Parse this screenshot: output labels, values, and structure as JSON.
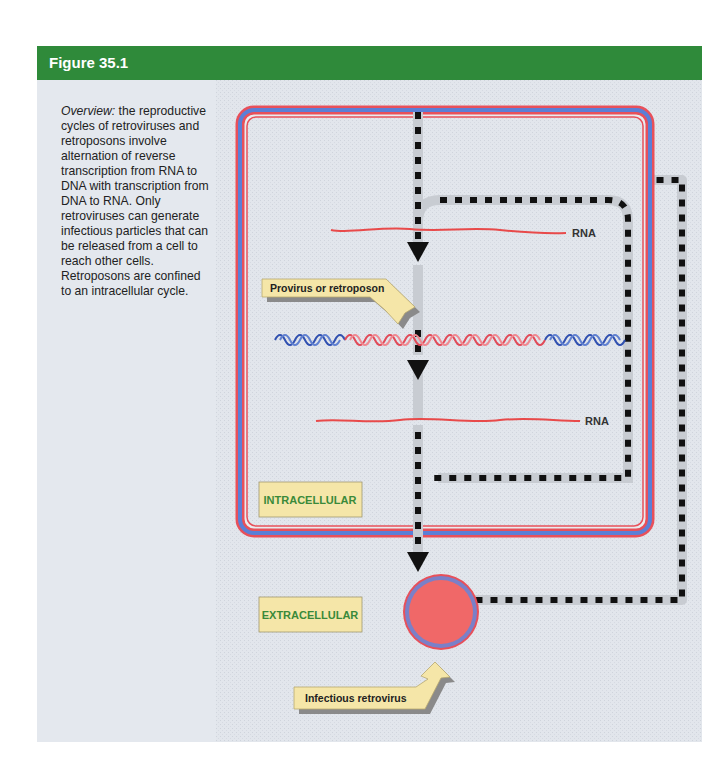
{
  "figure": {
    "title": "Figure 35.1",
    "caption_lead": "Overview:",
    "caption_body": " the reproductive cycles of retroviruses and retroposons involve alternation of reverse transcription from RNA to DNA with transcription from DNA to RNA. Only retroviruses can generate infectious particles that can be released from a cell to reach other cells. Retroposons are confined to an intracellular cycle."
  },
  "diagram": {
    "rna_top_label": "RNA",
    "rna_bottom_label": "RNA",
    "provirus_callout": "Provirus or retroposon",
    "intracellular_label": "INTRACELLULAR",
    "extracellular_label": "EXTRACELLULAR",
    "retrovirus_callout": "Infectious retrovirus",
    "colors": {
      "header_green": "#2f8a3a",
      "membrane_red": "#e8505a",
      "membrane_blue": "#5b7fd6",
      "label_box": "#f5e6a8",
      "label_green": "#3a8a3a",
      "virion_fill": "#f06868"
    }
  }
}
